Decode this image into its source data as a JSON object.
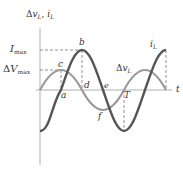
{
  "diagram": {
    "y_axis_label": {
      "prefix": "Δ",
      "v": "v",
      "v_sub": "L",
      "sep": ", ",
      "i": "i",
      "i_sub": "L"
    },
    "x_axis_label": "t",
    "levels": {
      "i_max": {
        "main": "I",
        "sub": "max"
      },
      "dv_max": {
        "prefix": "Δ",
        "main": "V",
        "sub": "max"
      }
    },
    "curve_labels": {
      "current": {
        "main": "i",
        "sub": "L"
      },
      "voltage": {
        "prefix": "Δ",
        "main": "v",
        "sub": "L"
      }
    },
    "points": {
      "a": "a",
      "b": "b",
      "c": "c",
      "d": "d",
      "e": "e",
      "f": "f",
      "T": "T"
    },
    "colors": {
      "current_curve": "#555555",
      "voltage_curve": "#9a9a9a",
      "axes": "#aaaaaa",
      "dashes": "#777777",
      "text": "#333333"
    }
  }
}
